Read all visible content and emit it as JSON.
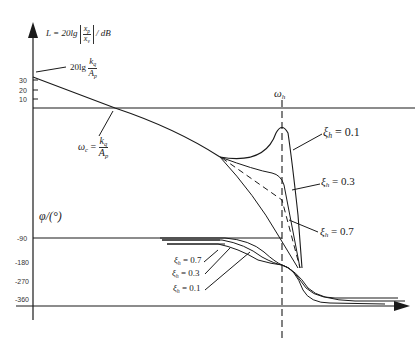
{
  "diagram": {
    "type": "bode-plot",
    "magnitude_axis": {
      "label_prefix": "L = 20lg",
      "label_fraction_num": "x",
      "label_fraction_num_sub": "p",
      "label_fraction_den": "x",
      "label_fraction_den_sub": "v",
      "label_unit": "/ dB",
      "ticks": [
        "30",
        "20",
        "10"
      ]
    },
    "gain_annotation": {
      "prefix": "20lg",
      "num": "k",
      "num_sub": "q",
      "den": "A",
      "den_sub": "p"
    },
    "crossover_annotation": {
      "lhs": "ω",
      "lhs_sub": "c",
      "eq": "=",
      "num": "k",
      "num_sub": "q",
      "den": "A",
      "den_sub": "p"
    },
    "omega_h_label": "ω",
    "omega_h_sub": "h",
    "magnitude_curves": [
      {
        "label": "ξ",
        "sub": "h",
        "value": "= 0.1"
      },
      {
        "label": "ξ",
        "sub": "h",
        "value": "= 0.3"
      },
      {
        "label": "ξ",
        "sub": "h",
        "value": "= 0.7"
      }
    ],
    "phase_axis": {
      "label": "φ/(°)",
      "ticks": [
        "-90",
        "-180",
        "-270",
        "-360"
      ]
    },
    "phase_curves": [
      {
        "label": "ξ",
        "sub": "h",
        "value": "= 0.7"
      },
      {
        "label": "ξ",
        "sub": "h",
        "value": "= 0.3"
      },
      {
        "label": "ξ",
        "sub": "h",
        "value": "= 0.1"
      }
    ],
    "colors": {
      "line": "#1a1a1a",
      "background": "#ffffff"
    }
  }
}
